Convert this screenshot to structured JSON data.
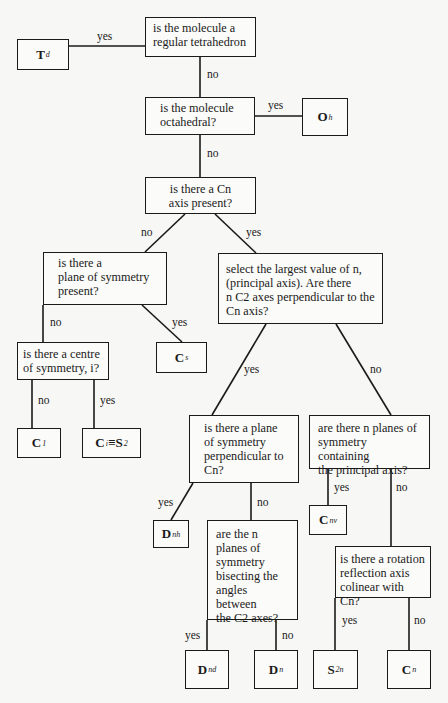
{
  "diagram": {
    "questions": {
      "q_tetrahedron": "is the molecule a\nregular tetrahedron",
      "q_octahedral": "is the molecule\noctahedral?",
      "q_cn_axis": "is there a Cn\naxis present?",
      "q_plane": "is there a\nplane of symmetry\npresent?",
      "q_select": "select the largest value of n,\n(principal axis). Are there\nn C2 axes perpendicular to the\nCn axis?",
      "q_centre": "is there a centre\nof symmetry, i?",
      "q_perp_plane": "is there a plane\nof symmetry\nperpendicular to\nCn?",
      "q_n_planes": "are there n planes of\nsymmetry containing\nthe principal axis?",
      "q_bisect": "are the n\nplanes of\nsymmetry\nbisecting the\nangles between\nthe C2 axes?",
      "q_rotation": "is there a rotation\nreflection axis\ncolinear with Cn?"
    },
    "results": {
      "td": {
        "main": "T",
        "sub": "d"
      },
      "oh": {
        "main": "O",
        "sub": "h"
      },
      "cs": {
        "main": "C",
        "sub": "s"
      },
      "c1": {
        "main": "C",
        "sub": "1"
      },
      "ci": {
        "main": "C",
        "sub": "i",
        "equiv": "≡S",
        "equiv_sub": "2"
      },
      "dnh": {
        "main": "D",
        "sub": "nh"
      },
      "cnv": {
        "main": "C",
        "sub": "nv"
      },
      "dnd": {
        "main": "D",
        "sub": "nd"
      },
      "dn": {
        "main": "D",
        "sub": "n"
      },
      "s2n": {
        "main": "S",
        "sub": "2n"
      },
      "cn": {
        "main": "C",
        "sub": "n"
      }
    },
    "edge_labels": {
      "yes": "yes",
      "no": "no"
    }
  }
}
